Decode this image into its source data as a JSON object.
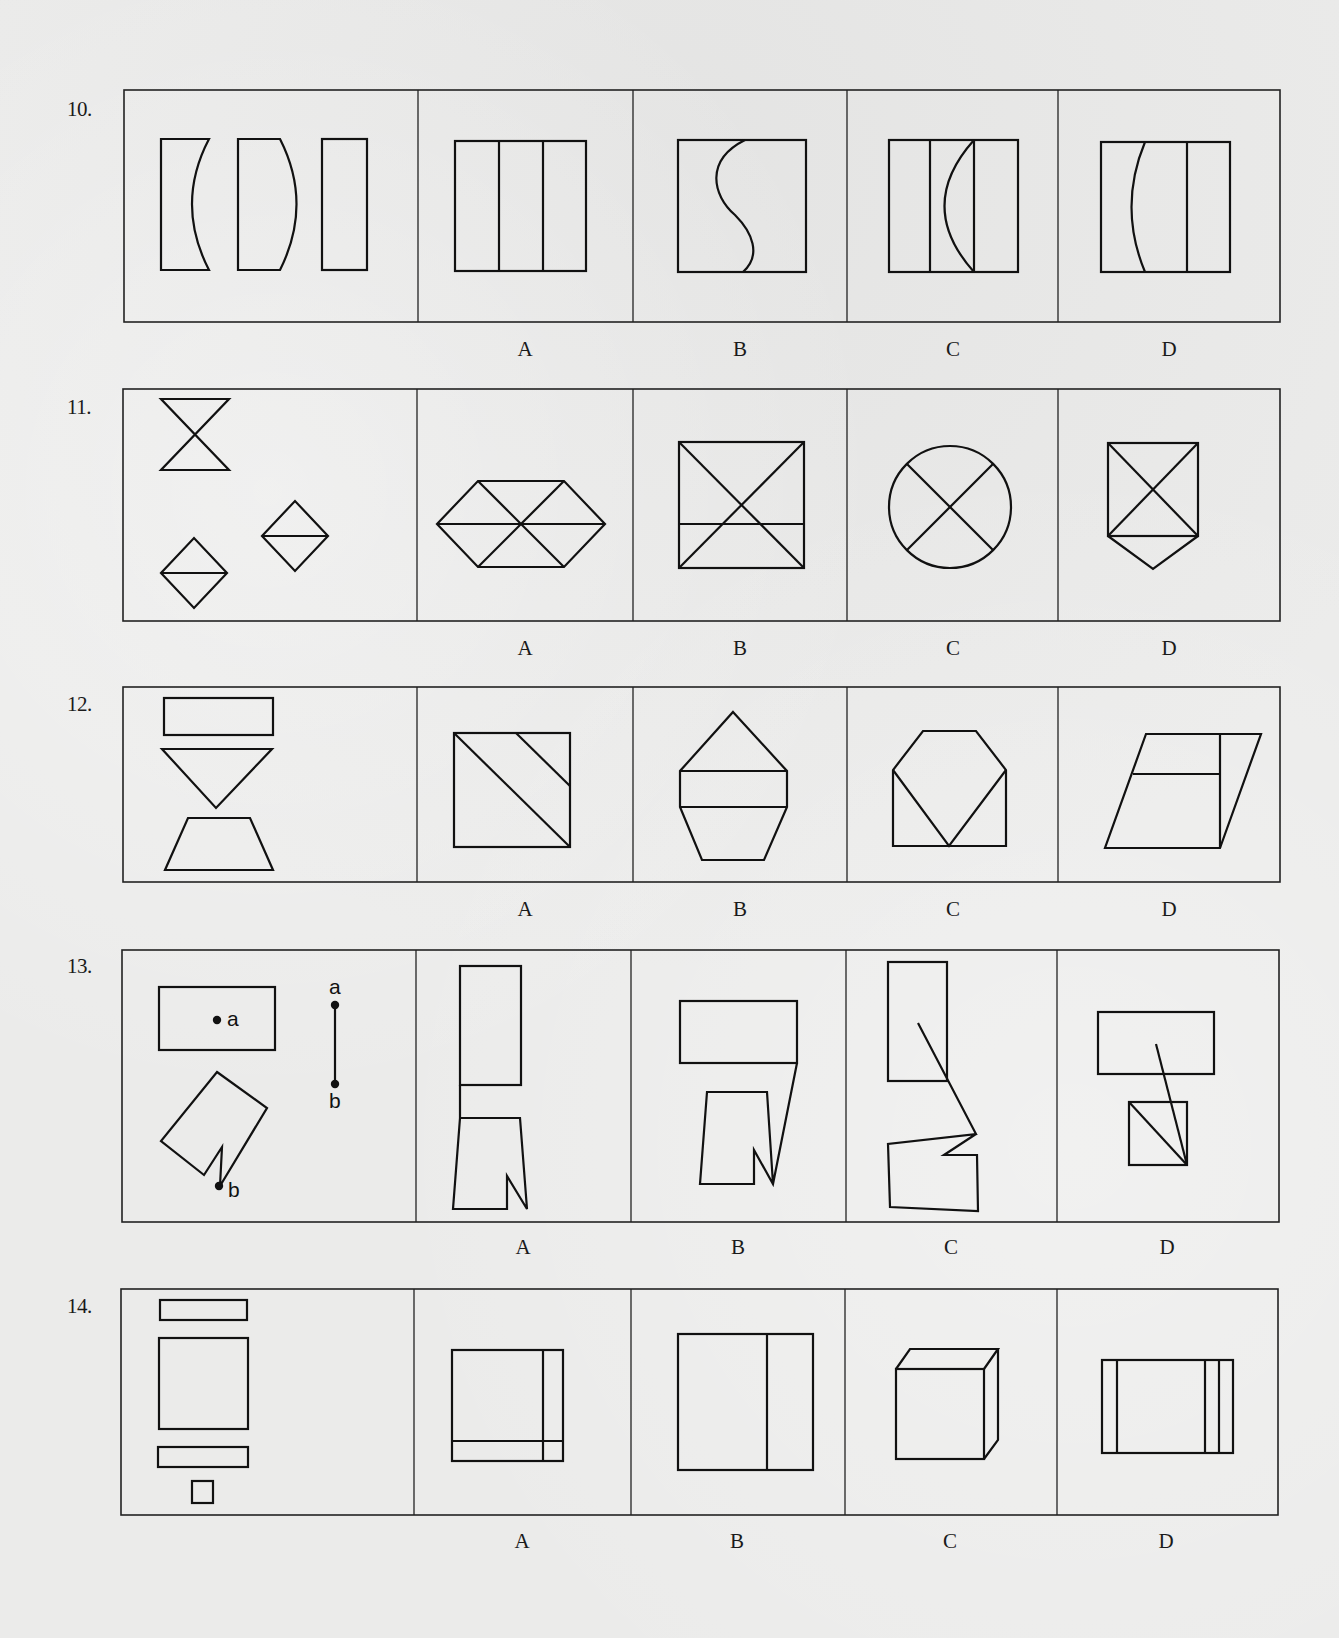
{
  "colors": {
    "ink": "#111111",
    "frame": "#222222",
    "paper": "#ebebea"
  },
  "questions": [
    {
      "number": "10.",
      "num_pos": [
        67,
        118
      ],
      "frame": {
        "x": 124,
        "y": 90,
        "w": 1156,
        "h": 232
      },
      "dividers": [
        418,
        633,
        847,
        1058
      ],
      "labels": [
        {
          "text": "A",
          "x": 525,
          "y": 358
        },
        {
          "text": "B",
          "x": 740,
          "y": 358
        },
        {
          "text": "C",
          "x": 953,
          "y": 358
        },
        {
          "text": "D",
          "x": 1169,
          "y": 358
        }
      ],
      "shapes": [
        {
          "type": "path",
          "d": "M161,139 L209,139 Q175,204 209,270 L161,270 Z"
        },
        {
          "type": "path",
          "d": "M238,139 L280,139 Q313,204 280,270 L238,270 Z"
        },
        {
          "type": "rect",
          "x": 322,
          "y": 139,
          "w": 45,
          "h": 131
        },
        {
          "type": "rect",
          "x": 455,
          "y": 141,
          "w": 131,
          "h": 130
        },
        {
          "type": "line",
          "x1": 499,
          "y1": 141,
          "x2": 499,
          "y2": 271
        },
        {
          "type": "line",
          "x1": 543,
          "y1": 141,
          "x2": 543,
          "y2": 271
        },
        {
          "type": "rect",
          "x": 678,
          "y": 140,
          "w": 128,
          "h": 132
        },
        {
          "type": "path",
          "d": "M745,140 C705,160 712,195 735,215 C752,232 762,255 743,272"
        },
        {
          "type": "rect",
          "x": 889,
          "y": 140,
          "w": 129,
          "h": 132
        },
        {
          "type": "line",
          "x1": 930,
          "y1": 140,
          "x2": 930,
          "y2": 272
        },
        {
          "type": "line",
          "x1": 974,
          "y1": 140,
          "x2": 974,
          "y2": 272
        },
        {
          "type": "path",
          "d": "M974,140 Q915,206 974,272"
        },
        {
          "type": "rect",
          "x": 1101,
          "y": 142,
          "w": 129,
          "h": 130
        },
        {
          "type": "path",
          "d": "M1145,142 Q1118,207 1145,272"
        },
        {
          "type": "line",
          "x1": 1187,
          "y1": 142,
          "x2": 1187,
          "y2": 272
        }
      ]
    },
    {
      "number": "11.",
      "num_pos": [
        67,
        416
      ],
      "frame": {
        "x": 123,
        "y": 389,
        "w": 1157,
        "h": 232
      },
      "dividers": [
        417,
        633,
        847,
        1058
      ],
      "labels": [
        {
          "text": "A",
          "x": 525,
          "y": 657
        },
        {
          "text": "B",
          "x": 740,
          "y": 657
        },
        {
          "text": "C",
          "x": 953,
          "y": 657
        },
        {
          "text": "D",
          "x": 1169,
          "y": 657
        }
      ],
      "shapes": [
        {
          "type": "poly",
          "points": "161,399 229,399 161,470 229,470",
          "closed": true
        },
        {
          "type": "poly",
          "points": "161,573 194,538 227,573 194,608",
          "closed": true
        },
        {
          "type": "line",
          "x1": 161,
          "y1": 573,
          "x2": 227,
          "y2": 573
        },
        {
          "type": "poly",
          "points": "262,536 295,501 328,536 295,571",
          "closed": true
        },
        {
          "type": "line",
          "x1": 262,
          "y1": 536,
          "x2": 328,
          "y2": 536
        },
        {
          "type": "poly",
          "points": "437,524 478,481 564,481 605,524 564,567 478,567",
          "closed": true
        },
        {
          "type": "line",
          "x1": 437,
          "y1": 524,
          "x2": 605,
          "y2": 524
        },
        {
          "type": "line",
          "x1": 478,
          "y1": 481,
          "x2": 564,
          "y2": 567
        },
        {
          "type": "line",
          "x1": 564,
          "y1": 481,
          "x2": 478,
          "y2": 567
        },
        {
          "type": "rect",
          "x": 679,
          "y": 442,
          "w": 125,
          "h": 126
        },
        {
          "type": "line",
          "x1": 679,
          "y1": 442,
          "x2": 804,
          "y2": 568
        },
        {
          "type": "line",
          "x1": 804,
          "y1": 442,
          "x2": 679,
          "y2": 568
        },
        {
          "type": "line",
          "x1": 679,
          "y1": 524,
          "x2": 804,
          "y2": 524
        },
        {
          "type": "circle",
          "cx": 950,
          "cy": 507,
          "r": 61
        },
        {
          "type": "line",
          "x1": 907,
          "y1": 464,
          "x2": 993,
          "y2": 550
        },
        {
          "type": "line",
          "x1": 993,
          "y1": 464,
          "x2": 907,
          "y2": 550
        },
        {
          "type": "rect",
          "x": 1108,
          "y": 443,
          "w": 90,
          "h": 93
        },
        {
          "type": "line",
          "x1": 1108,
          "y1": 443,
          "x2": 1198,
          "y2": 536
        },
        {
          "type": "line",
          "x1": 1198,
          "y1": 443,
          "x2": 1108,
          "y2": 536
        },
        {
          "type": "poly",
          "points": "1108,536 1153,569 1198,536",
          "closed": false
        }
      ]
    },
    {
      "number": "12.",
      "num_pos": [
        67,
        713
      ],
      "frame": {
        "x": 123,
        "y": 687,
        "w": 1157,
        "h": 195
      },
      "dividers": [
        417,
        633,
        847,
        1058
      ],
      "labels": [
        {
          "text": "A",
          "x": 525,
          "y": 918
        },
        {
          "text": "B",
          "x": 740,
          "y": 918
        },
        {
          "text": "C",
          "x": 953,
          "y": 918
        },
        {
          "text": "D",
          "x": 1169,
          "y": 918
        }
      ],
      "shapes": [
        {
          "type": "rect",
          "x": 164,
          "y": 698,
          "w": 109,
          "h": 37
        },
        {
          "type": "poly",
          "points": "162,749 272,749 216,808",
          "closed": true
        },
        {
          "type": "poly",
          "points": "188,818 250,818 273,870 165,870",
          "closed": true
        },
        {
          "type": "rect",
          "x": 454,
          "y": 733,
          "w": 116,
          "h": 114
        },
        {
          "type": "line",
          "x1": 454,
          "y1": 733,
          "x2": 570,
          "y2": 847
        },
        {
          "type": "line",
          "x1": 516,
          "y1": 733,
          "x2": 570,
          "y2": 786
        },
        {
          "type": "poly",
          "points": "733,712 787,771 787,807 764,860 702,860 680,807 680,771",
          "closed": true
        },
        {
          "type": "line",
          "x1": 680,
          "y1": 771,
          "x2": 787,
          "y2": 771
        },
        {
          "type": "line",
          "x1": 680,
          "y1": 807,
          "x2": 787,
          "y2": 807
        },
        {
          "type": "poly",
          "points": "923,731 976,731 1006,770 1006,846 893,846 893,770",
          "closed": true
        },
        {
          "type": "poly",
          "points": "893,770 949,846 1006,770",
          "closed": false
        },
        {
          "type": "poly",
          "points": "1146,734 1261,734 1220,848 1105,848",
          "closed": true
        },
        {
          "type": "line",
          "x1": 1220,
          "y1": 734,
          "x2": 1220,
          "y2": 848
        },
        {
          "type": "line",
          "x1": 1133,
          "y1": 774,
          "x2": 1220,
          "y2": 774
        }
      ]
    },
    {
      "number": "13.",
      "num_pos": [
        67,
        975
      ],
      "frame": {
        "x": 122,
        "y": 950,
        "w": 1157,
        "h": 272
      },
      "dividers": [
        416,
        631,
        846,
        1057
      ],
      "labels": [
        {
          "text": "A",
          "x": 523,
          "y": 1256
        },
        {
          "text": "B",
          "x": 738,
          "y": 1256
        },
        {
          "text": "C",
          "x": 951,
          "y": 1256
        },
        {
          "text": "D",
          "x": 1167,
          "y": 1256
        }
      ],
      "shapes": [
        {
          "type": "rect",
          "x": 159,
          "y": 987,
          "w": 116,
          "h": 63
        },
        {
          "type": "dot",
          "cx": 217,
          "cy": 1020
        },
        {
          "type": "text",
          "x": 227,
          "y": 1026,
          "text": "a"
        },
        {
          "type": "line",
          "x1": 335,
          "y1": 1005,
          "x2": 335,
          "y2": 1084
        },
        {
          "type": "dot",
          "cx": 335,
          "cy": 1005
        },
        {
          "type": "dot",
          "cx": 335,
          "cy": 1084
        },
        {
          "type": "text",
          "x": 329,
          "y": 994,
          "text": "a"
        },
        {
          "type": "text",
          "x": 329,
          "y": 1108,
          "text": "b"
        },
        {
          "type": "poly",
          "points": "217,1072 267,1108 220,1186 222,1147 204,1175 161,1141",
          "closed": true
        },
        {
          "type": "dot",
          "cx": 219,
          "cy": 1186
        },
        {
          "type": "text",
          "x": 228,
          "y": 1197,
          "text": "b"
        },
        {
          "type": "rect",
          "x": 460,
          "y": 966,
          "w": 61,
          "h": 119
        },
        {
          "type": "poly",
          "points": "460,1085 460,1118 520,1118 527,1209 507,1176 507,1209 453,1209 460,1118",
          "closed": false
        },
        {
          "type": "rect",
          "x": 680,
          "y": 1001,
          "w": 117,
          "h": 62
        },
        {
          "type": "poly",
          "points": "797,1063 773,1184 754,1150 754,1184 700,1184 707,1092 767,1092 773,1184",
          "closed": false
        },
        {
          "type": "rect",
          "x": 888,
          "y": 962,
          "w": 59,
          "h": 119
        },
        {
          "type": "poly",
          "points": "918,1023 976,1134 888,1144 890,1207 978,1211 977,1155 944,1155 976,1134",
          "closed": false
        },
        {
          "type": "rect",
          "x": 1098,
          "y": 1012,
          "w": 116,
          "h": 62
        },
        {
          "type": "rect",
          "x": 1129,
          "y": 1102,
          "w": 58,
          "h": 63
        },
        {
          "type": "line",
          "x1": 1129,
          "y1": 1102,
          "x2": 1187,
          "y2": 1165
        },
        {
          "type": "line",
          "x1": 1156,
          "y1": 1044,
          "x2": 1187,
          "y2": 1165
        }
      ]
    },
    {
      "number": "14.",
      "num_pos": [
        67,
        1315
      ],
      "frame": {
        "x": 121,
        "y": 1289,
        "w": 1157,
        "h": 226
      },
      "dividers": [
        414,
        631,
        845,
        1057
      ],
      "labels": [
        {
          "text": "A",
          "x": 522,
          "y": 1550
        },
        {
          "text": "B",
          "x": 737,
          "y": 1550
        },
        {
          "text": "C",
          "x": 950,
          "y": 1550
        },
        {
          "text": "D",
          "x": 1166,
          "y": 1550
        }
      ],
      "shapes": [
        {
          "type": "rect",
          "x": 160,
          "y": 1300,
          "w": 87,
          "h": 20
        },
        {
          "type": "rect",
          "x": 159,
          "y": 1338,
          "w": 89,
          "h": 91
        },
        {
          "type": "rect",
          "x": 158,
          "y": 1447,
          "w": 90,
          "h": 20
        },
        {
          "type": "rect",
          "x": 192,
          "y": 1481,
          "w": 21,
          "h": 22
        },
        {
          "type": "rect",
          "x": 452,
          "y": 1350,
          "w": 111,
          "h": 111
        },
        {
          "type": "line",
          "x1": 543,
          "y1": 1350,
          "x2": 543,
          "y2": 1461
        },
        {
          "type": "line",
          "x1": 452,
          "y1": 1441,
          "x2": 563,
          "y2": 1441
        },
        {
          "type": "rect",
          "x": 678,
          "y": 1334,
          "w": 135,
          "h": 136
        },
        {
          "type": "line",
          "x1": 767,
          "y1": 1334,
          "x2": 767,
          "y2": 1470
        },
        {
          "type": "rect",
          "x": 896,
          "y": 1369,
          "w": 88,
          "h": 90
        },
        {
          "type": "poly",
          "points": "896,1369 910,1349 998,1349 984,1369",
          "closed": false
        },
        {
          "type": "poly",
          "points": "998,1349 998,1440 984,1459",
          "closed": false
        },
        {
          "type": "rect",
          "x": 1102,
          "y": 1360,
          "w": 131,
          "h": 93
        },
        {
          "type": "line",
          "x1": 1117,
          "y1": 1360,
          "x2": 1117,
          "y2": 1453
        },
        {
          "type": "line",
          "x1": 1205,
          "y1": 1360,
          "x2": 1205,
          "y2": 1453
        },
        {
          "type": "line",
          "x1": 1219,
          "y1": 1360,
          "x2": 1219,
          "y2": 1453
        }
      ]
    }
  ]
}
